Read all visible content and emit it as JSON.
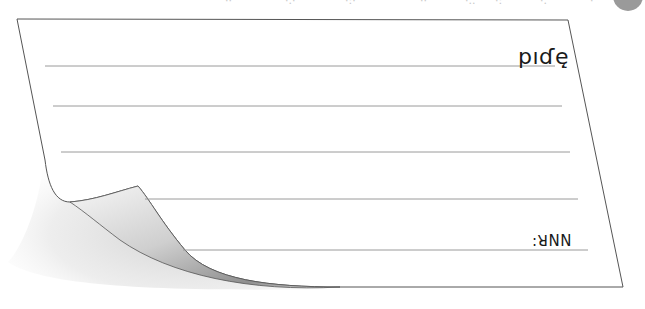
{
  "top_strip": {
    "fragments": [
      "··",
      "·.·",
      "·:·",
      "··",
      "·..",
      "·:",
      "·.",
      "·"
    ],
    "circle_color": "#9a9a9a"
  },
  "card": {
    "title_text": "pıɗę̣",
    "signature_text": ":ꓤNN",
    "line_color": "#9a9a9a",
    "border_color": "#555555",
    "paper_color": "#ffffff",
    "curl_shadow_color": "#8a8a8a"
  }
}
